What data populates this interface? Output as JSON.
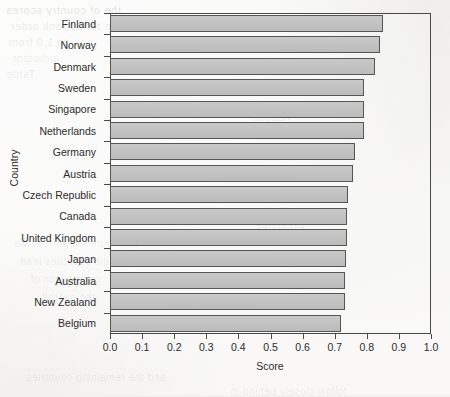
{
  "chart_data": {
    "type": "bar",
    "orientation": "horizontal",
    "title": "",
    "xlabel": "Score",
    "ylabel": "Country",
    "xlim": [
      0.0,
      1.0
    ],
    "xticks": [
      "0.0",
      "0.1",
      "0.2",
      "0.3",
      "0.4",
      "0.5",
      "0.6",
      "0.7",
      "0.8",
      "0.9",
      "1.0"
    ],
    "xtick_values": [
      0.0,
      0.1,
      0.2,
      0.3,
      0.4,
      0.5,
      0.6,
      0.7,
      0.8,
      0.9,
      1.0
    ],
    "grid": false,
    "legend": "none",
    "categories": [
      "Finland",
      "Norway",
      "Denmark",
      "Sweden",
      "Singapore",
      "Netherlands",
      "Germany",
      "Austria",
      "Czech Republic",
      "Canada",
      "United Kingdom",
      "Japan",
      "Australia",
      "New Zealand",
      "Belgium"
    ],
    "values": [
      0.85,
      0.84,
      0.825,
      0.79,
      0.79,
      0.79,
      0.762,
      0.758,
      0.74,
      0.737,
      0.737,
      0.735,
      0.733,
      0.731,
      0.72
    ],
    "bar_fill_color": "#c2c2c2",
    "bar_edge_color": "#565656",
    "axis_color": "#4a4a4a",
    "background_color": "#f1f0ee"
  },
  "ghost_text": [
    {
      "text": "the of country scores",
      "x": 6,
      "y": 4,
      "size": 11,
      "cls": "ghost"
    },
    {
      "text": "in terms rank order",
      "x": 10,
      "y": 20,
      "size": 11,
      "cls": "ghost g2"
    },
    {
      "text": "to 1.0 from",
      "x": 8,
      "y": 36,
      "size": 11,
      "cls": "ghost g2"
    },
    {
      "text": "indicator",
      "x": 12,
      "y": 52,
      "size": 11,
      "cls": "ghost g3"
    },
    {
      "text": "Table",
      "x": 6,
      "y": 68,
      "size": 11,
      "cls": "ghost g3"
    },
    {
      "text": "national",
      "x": 250,
      "y": 112,
      "size": 10,
      "cls": "ghost g3"
    },
    {
      "text": "survey data",
      "x": 262,
      "y": 128,
      "size": 10,
      "cls": "ghost g3"
    },
    {
      "text": "values",
      "x": 276,
      "y": 146,
      "size": 10,
      "cls": "ghost g3"
    },
    {
      "text": "reported",
      "x": 268,
      "y": 206,
      "size": 10,
      "cls": "ghost g3"
    },
    {
      "text": "estimates",
      "x": 256,
      "y": 222,
      "size": 10,
      "cls": "ghost g3"
    },
    {
      "text": "the figure shows that the",
      "x": 14,
      "y": 238,
      "size": 10,
      "cls": "ghost g3"
    },
    {
      "text": "nordic countries lead",
      "x": 20,
      "y": 256,
      "size": 10,
      "cls": "ghost g3"
    },
    {
      "text": "comparison of",
      "x": 30,
      "y": 274,
      "size": 10,
      "cls": "ghost g3"
    },
    {
      "text": "the overall",
      "x": 42,
      "y": 292,
      "size": 10,
      "cls": "ghost g3"
    },
    {
      "text": "and the remaining countries",
      "x": 26,
      "y": 372,
      "size": 10,
      "cls": "ghost g3"
    },
    {
      "text": "follow closely behind in",
      "x": 230,
      "y": 386,
      "size": 10,
      "cls": "ghost g3"
    }
  ]
}
